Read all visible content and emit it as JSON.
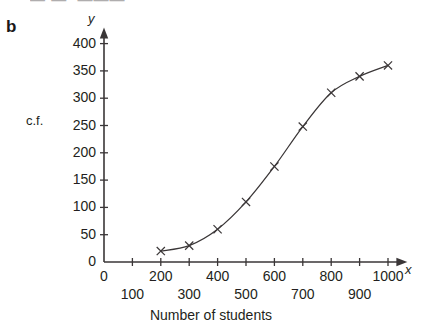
{
  "part_label": "b",
  "top_fragment": "— —, ———",
  "axis_letters": {
    "y": "y",
    "x": "x"
  },
  "y_axis_caption": "c.f.",
  "x_axis_title": "Number of students",
  "colors": {
    "axis": "#3a3637",
    "curve": "#3a3637",
    "marker": "#3a3637",
    "text": "#231f20",
    "background": "#ffffff"
  },
  "chart_data": {
    "type": "line",
    "title": "",
    "subtitle": "",
    "xlabel": "Number of students",
    "ylabel": "c.f.",
    "xlim": [
      0,
      1050
    ],
    "ylim": [
      0,
      420
    ],
    "grid": false,
    "legend": false,
    "marker": "x",
    "x": [
      200,
      300,
      400,
      500,
      600,
      700,
      800,
      900,
      1000
    ],
    "values": [
      20,
      30,
      60,
      110,
      175,
      248,
      310,
      340,
      360
    ],
    "series": [
      {
        "name": "cumulative frequency",
        "values": [
          20,
          30,
          60,
          110,
          175,
          248,
          310,
          340,
          360
        ]
      }
    ],
    "y_ticks": [
      0,
      50,
      100,
      150,
      200,
      250,
      300,
      350,
      400
    ],
    "y_tick_labels": [
      "0",
      "50",
      "100",
      "150",
      "200",
      "250",
      "300",
      "350",
      "400"
    ],
    "x_ticks": [
      0,
      100,
      200,
      300,
      400,
      500,
      600,
      700,
      800,
      900,
      1000
    ],
    "x_tick_labels_row1": [
      "0",
      "200",
      "400",
      "600",
      "800",
      "1000"
    ],
    "x_tick_values_row1": [
      0,
      200,
      400,
      600,
      800,
      1000
    ],
    "x_tick_labels_row2": [
      "100",
      "300",
      "500",
      "700",
      "900"
    ],
    "x_tick_values_row2": [
      100,
      300,
      500,
      700,
      900
    ]
  }
}
